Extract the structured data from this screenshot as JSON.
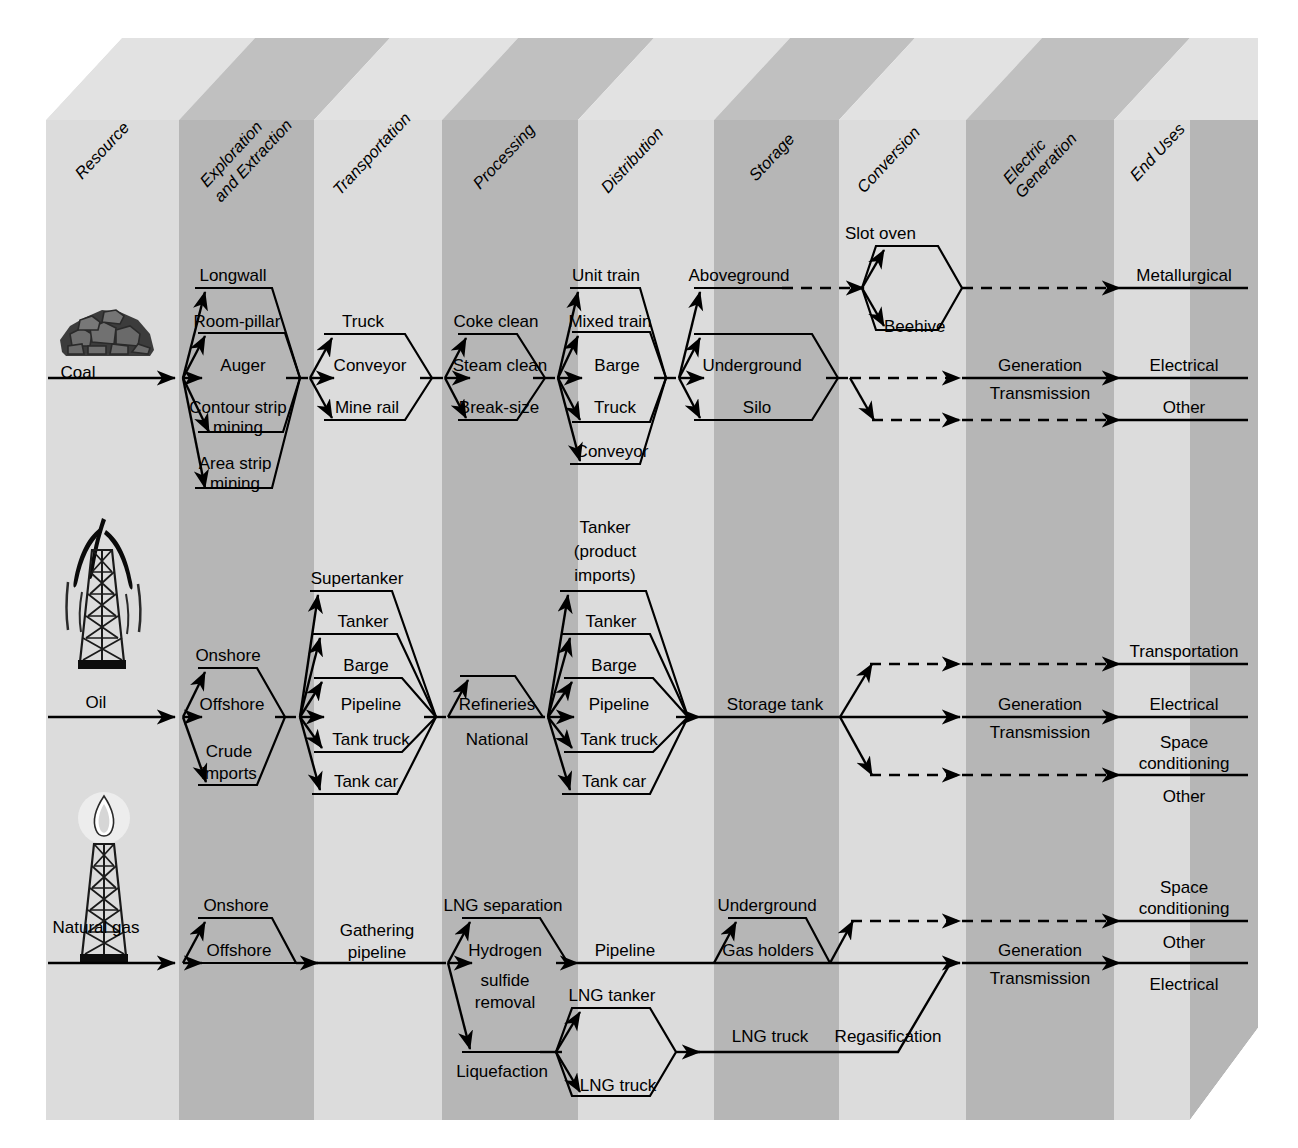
{
  "columns": [
    {
      "id": "resource",
      "label": "Resource",
      "shade": "light"
    },
    {
      "id": "exploration",
      "label": "Exploration\nand Extraction",
      "label_line1": "Exploration",
      "label_line2": "and Extraction",
      "shade": "dark"
    },
    {
      "id": "transportation",
      "label": "Transportation",
      "shade": "light"
    },
    {
      "id": "processing",
      "label": "Processing",
      "shade": "dark"
    },
    {
      "id": "distribution",
      "label": "Distribution",
      "shade": "light"
    },
    {
      "id": "storage",
      "label": "Storage",
      "shade": "dark"
    },
    {
      "id": "conversion",
      "label": "Conversion",
      "shade": "light"
    },
    {
      "id": "electric",
      "label": "Electric\nGeneration",
      "label_line1": "Electric",
      "label_line2": "Generation",
      "shade": "dark"
    },
    {
      "id": "enduses",
      "label": "End Uses",
      "shade": "light"
    }
  ],
  "colors": {
    "light": "#d9d9d9",
    "dark": "#b4b4b4",
    "top_light": "#e0e0e0",
    "top_dark": "#bdbdbd",
    "side": "#c9c9c9",
    "line": "#000000"
  },
  "rows": [
    {
      "id": "coal",
      "resource_label": "Coal",
      "icon": "coal-pile-icon",
      "exploration": [
        "Longwall",
        "Room-pillar",
        "Auger",
        "Contour strip\nmining",
        "Area strip\nmining"
      ],
      "exploration_items": [
        {
          "l1": "Longwall",
          "l2": ""
        },
        {
          "l1": "Room-pillar",
          "l2": ""
        },
        {
          "l1": "Auger",
          "l2": ""
        },
        {
          "l1": "Contour strip",
          "l2": "mining"
        },
        {
          "l1": "Area strip",
          "l2": "mining"
        }
      ],
      "transportation": [
        "Truck",
        "Conveyor",
        "Mine rail"
      ],
      "processing": [
        "Coke clean",
        "Steam clean",
        "Break-size"
      ],
      "distribution": [
        "Unit train",
        "Mixed train",
        "Barge",
        "Truck",
        "Conveyor"
      ],
      "storage": [
        "Aboveground",
        "Underground",
        "Silo"
      ],
      "conversion": [
        "Slot oven",
        "Beehive"
      ],
      "electric": [
        "Generation",
        "Transmission"
      ],
      "enduses": [
        "Metallurgical",
        "Electrical",
        "Other"
      ]
    },
    {
      "id": "oil",
      "resource_label": "Oil",
      "icon": "oil-derrick-icon",
      "exploration": [
        "Onshore",
        "Offshore",
        "Crude\nimports"
      ],
      "exploration_items": [
        {
          "l1": "Onshore",
          "l2": ""
        },
        {
          "l1": "Offshore",
          "l2": ""
        },
        {
          "l1": "Crude",
          "l2": "imports"
        }
      ],
      "transportation": [
        "Supertanker",
        "Tanker",
        "Barge",
        "Pipeline",
        "Tank truck",
        "Tank car"
      ],
      "processing": [
        "Refineries",
        "National"
      ],
      "distribution": [
        "Tanker\n(product\nimports)",
        "Tanker",
        "Barge",
        "Pipeline",
        "Tank truck",
        "Tank car"
      ],
      "distribution_items": [
        {
          "l1": "Tanker",
          "l2": "(product",
          "l3": "imports)"
        },
        {
          "l1": "Tanker",
          "l2": "",
          "l3": ""
        },
        {
          "l1": "Barge",
          "l2": "",
          "l3": ""
        },
        {
          "l1": "Pipeline",
          "l2": "",
          "l3": ""
        },
        {
          "l1": "Tank truck",
          "l2": "",
          "l3": ""
        },
        {
          "l1": "Tank car",
          "l2": "",
          "l3": ""
        }
      ],
      "storage": [
        "Storage tank"
      ],
      "conversion": [],
      "electric": [
        "Generation",
        "Transmission"
      ],
      "enduses": [
        "Transportation",
        "Electrical",
        "Space\nconditioning",
        "Other"
      ],
      "enduses_items": [
        {
          "l1": "Transportation",
          "l2": ""
        },
        {
          "l1": "Electrical",
          "l2": ""
        },
        {
          "l1": "Space",
          "l2": "conditioning"
        },
        {
          "l1": "Other",
          "l2": ""
        }
      ]
    },
    {
      "id": "gas",
      "resource_label": "Natural gas",
      "icon": "gas-flare-derrick-icon",
      "exploration": [
        "Onshore",
        "Offshore"
      ],
      "transportation": [
        "Gathering\npipeline"
      ],
      "transportation_items": [
        {
          "l1": "Gathering",
          "l2": "pipeline"
        }
      ],
      "processing": [
        "LNG separation",
        "Hydrogen\nsulfide\nremoval",
        "Liquefaction"
      ],
      "processing_items": [
        {
          "l1": "LNG separation",
          "l2": "",
          "l3": ""
        },
        {
          "l1": "Hydrogen",
          "l2": "sulfide",
          "l3": "removal"
        },
        {
          "l1": "Liquefaction",
          "l2": "",
          "l3": ""
        }
      ],
      "distribution": [
        "Pipeline",
        "LNG tanker",
        "LNG truck"
      ],
      "storage": [
        "Underground",
        "Gas holders",
        "LNG truck"
      ],
      "conversion": [
        "Regasification"
      ],
      "electric": [
        "Generation",
        "Transmission"
      ],
      "enduses": [
        "Space\nconditioning",
        "Other",
        "Electrical"
      ],
      "enduses_items": [
        {
          "l1": "Space",
          "l2": "conditioning"
        },
        {
          "l1": "Other",
          "l2": ""
        },
        {
          "l1": "Electrical",
          "l2": ""
        }
      ]
    }
  ]
}
